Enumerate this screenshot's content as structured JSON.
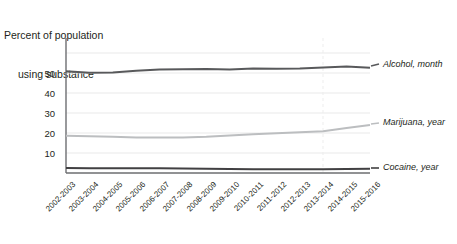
{
  "title": {
    "line1": "Percent of population",
    "line2": "using substance"
  },
  "axis": {
    "y_ticks": [
      "10",
      "20",
      "30",
      "40",
      "50"
    ],
    "x_ticks": [
      "2002-2003",
      "2003-2004",
      "2004-2005",
      "2005-2006",
      "2006-2007",
      "2007-2008",
      "2008-2009",
      "2009-2010",
      "2010-2011",
      "2011-2012",
      "2012-2013",
      "2013-2014",
      "2014-2015",
      "2015-2016"
    ]
  },
  "series_labels": {
    "alcohol": "Alcohol, month",
    "marijuana": "Marijuana, year",
    "cocaine": "Cocaine, year"
  },
  "colors": {
    "alcohol": "#58595b",
    "marijuana": "#bcbec0",
    "cocaine": "#414042",
    "grid": "#e6e6e6",
    "axis": "#6d6e71",
    "text": "#231f20"
  },
  "chart_data": {
    "type": "line",
    "title": "Percent of population using substance",
    "xlabel": "",
    "ylabel": "Percent of population using substance",
    "ylim": [
      0,
      58
    ],
    "yticks": [
      10,
      20,
      30,
      40,
      50
    ],
    "grid": true,
    "legend": "right-edge-inline-labels",
    "categories": [
      "2002-2003",
      "2003-2004",
      "2004-2005",
      "2005-2006",
      "2006-2007",
      "2007-2008",
      "2008-2009",
      "2009-2010",
      "2010-2011",
      "2011-2012",
      "2012-2013",
      "2013-2014",
      "2014-2015",
      "2015-2016"
    ],
    "series": [
      {
        "name": "Alcohol, month",
        "color": "#58595b",
        "values": [
          50.9,
          50.1,
          50.3,
          51.1,
          51.7,
          51.9,
          52.0,
          51.8,
          52.2,
          52.1,
          52.2,
          52.7,
          53.2,
          52.6
        ]
      },
      {
        "name": "Marijuana, year",
        "color": "#bcbec0",
        "values": [
          18.6,
          18.4,
          18.1,
          17.8,
          17.7,
          17.8,
          18.1,
          18.8,
          19.4,
          19.9,
          20.4,
          20.9,
          22.5,
          24.0
        ]
      },
      {
        "name": "Cocaine, year",
        "color": "#414042",
        "values": [
          2.5,
          2.4,
          2.4,
          2.4,
          2.4,
          2.3,
          2.1,
          2.0,
          1.9,
          1.9,
          1.9,
          1.9,
          2.0,
          2.1
        ]
      }
    ],
    "annotations": [
      {
        "type": "vertical-gridline",
        "at_category": "2013-2014",
        "style": "faint"
      }
    ]
  }
}
